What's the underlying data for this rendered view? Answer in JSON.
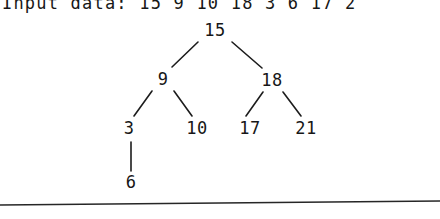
{
  "input_line": {
    "label": "Input data: 15 9 10 18 3 6 17 2"
  },
  "tree": {
    "nodes": [
      {
        "value": "15",
        "x": 215,
        "y": 30
      },
      {
        "value": "9",
        "x": 163,
        "y": 79
      },
      {
        "value": "18",
        "x": 272,
        "y": 80
      },
      {
        "value": "3",
        "x": 129,
        "y": 128
      },
      {
        "value": "10",
        "x": 197,
        "y": 128
      },
      {
        "value": "17",
        "x": 250,
        "y": 128
      },
      {
        "value": "21",
        "x": 306,
        "y": 128
      },
      {
        "value": "6",
        "x": 131,
        "y": 182
      }
    ],
    "edges": [
      {
        "x1": 198,
        "y1": 42,
        "x2": 172,
        "y2": 67
      },
      {
        "x1": 232,
        "y1": 42,
        "x2": 262,
        "y2": 68
      },
      {
        "x1": 152,
        "y1": 91,
        "x2": 134,
        "y2": 116
      },
      {
        "x1": 174,
        "y1": 91,
        "x2": 192,
        "y2": 116
      },
      {
        "x1": 263,
        "y1": 92,
        "x2": 246,
        "y2": 116
      },
      {
        "x1": 283,
        "y1": 92,
        "x2": 301,
        "y2": 116
      },
      {
        "x1": 131,
        "y1": 142,
        "x2": 131,
        "y2": 171
      }
    ]
  },
  "separator": {
    "x1": 0,
    "y1": 205,
    "x2": 440,
    "y2": 201
  },
  "colors": {
    "ink": "#171717",
    "paper": "#ffffff",
    "rule": "#262626"
  }
}
